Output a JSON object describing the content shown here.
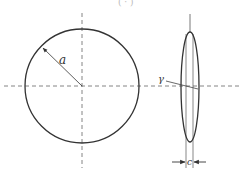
{
  "diagram": {
    "type": "penny-shaped crack / disc geometry",
    "clipped_top_text": "( ·  )",
    "labels": {
      "radius": "a",
      "angle": "γ",
      "thickness": "c"
    },
    "colors": {
      "stroke": "#333333",
      "dashed": "#666666",
      "background": "#ffffff"
    },
    "front_view": {
      "shape": "circle",
      "center": [
        82,
        86
      ],
      "radius": 57
    },
    "side_view": {
      "shape": "thin ellipse",
      "center": [
        190,
        87
      ],
      "rx": 9,
      "ry": 55
    }
  }
}
